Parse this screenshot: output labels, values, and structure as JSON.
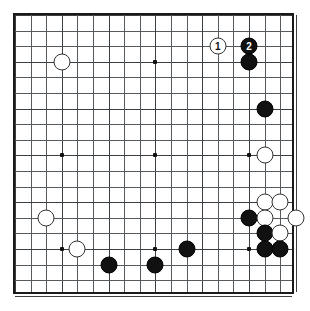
{
  "board": {
    "kind": "go-board-diagram",
    "size": 19,
    "grid_origin_x": 13,
    "grid_origin_y": 13,
    "grid_spacing": 15.6,
    "border_color": "#1a1a1a",
    "line_color": "#555a5e",
    "background_color": "#ffffff",
    "black_color": "#111111",
    "white_color": "#ffffff",
    "star_points": [
      {
        "col": 4,
        "row": 4
      },
      {
        "col": 10,
        "row": 4
      },
      {
        "col": 16,
        "row": 4
      },
      {
        "col": 4,
        "row": 10
      },
      {
        "col": 10,
        "row": 10
      },
      {
        "col": 16,
        "row": 10
      },
      {
        "col": 4,
        "row": 16
      },
      {
        "col": 10,
        "row": 16
      },
      {
        "col": 16,
        "row": 16
      }
    ],
    "stones": [
      {
        "id": "w-move-1",
        "color": "white",
        "col": 14,
        "row": 3,
        "label": "1"
      },
      {
        "id": "b-move-2",
        "color": "black",
        "col": 16,
        "row": 3,
        "label": "2"
      },
      {
        "id": "b-16-4",
        "color": "black",
        "col": 16,
        "row": 4,
        "label": ""
      },
      {
        "id": "w-4-4",
        "color": "white",
        "col": 4,
        "row": 4,
        "label": ""
      },
      {
        "id": "b-17-7",
        "color": "black",
        "col": 17,
        "row": 7,
        "label": ""
      },
      {
        "id": "w-17-10",
        "color": "white",
        "col": 17,
        "row": 10,
        "label": ""
      },
      {
        "id": "w-17-13",
        "color": "white",
        "col": 17,
        "row": 13,
        "label": ""
      },
      {
        "id": "w-18-13",
        "color": "white",
        "col": 18,
        "row": 13,
        "label": ""
      },
      {
        "id": "b-16-14",
        "color": "black",
        "col": 16,
        "row": 14,
        "label": ""
      },
      {
        "id": "w-17-14",
        "color": "white",
        "col": 17,
        "row": 14,
        "label": ""
      },
      {
        "id": "w-19-14",
        "color": "white",
        "col": 19,
        "row": 14,
        "label": ""
      },
      {
        "id": "b-17-15",
        "color": "black",
        "col": 17,
        "row": 15,
        "label": ""
      },
      {
        "id": "w-18-15",
        "color": "white",
        "col": 18,
        "row": 15,
        "label": ""
      },
      {
        "id": "b-17-16",
        "color": "black",
        "col": 17,
        "row": 16,
        "label": ""
      },
      {
        "id": "b-18-16",
        "color": "black",
        "col": 18,
        "row": 16,
        "label": ""
      },
      {
        "id": "w-3-14",
        "color": "white",
        "col": 3,
        "row": 14,
        "label": ""
      },
      {
        "id": "w-5-16",
        "color": "white",
        "col": 5,
        "row": 16,
        "label": ""
      },
      {
        "id": "b-12-16",
        "color": "black",
        "col": 12,
        "row": 16,
        "label": ""
      },
      {
        "id": "b-7-17",
        "color": "black",
        "col": 7,
        "row": 17,
        "label": ""
      },
      {
        "id": "b-10-17",
        "color": "black",
        "col": 10,
        "row": 17,
        "label": ""
      }
    ]
  }
}
